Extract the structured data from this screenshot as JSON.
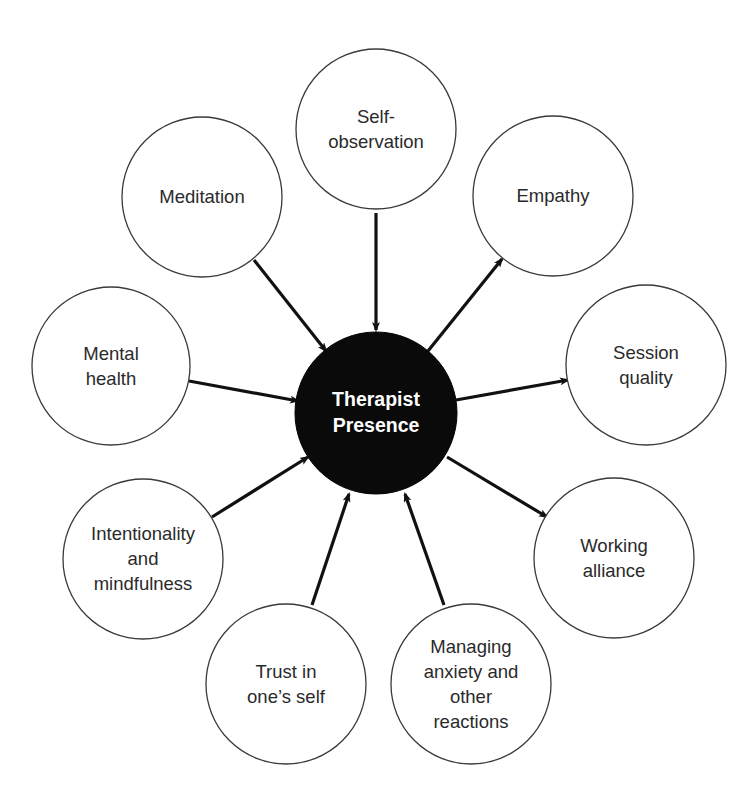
{
  "diagram": {
    "type": "hub-and-spoke",
    "center": {
      "id": "therapist-presence",
      "label_lines": [
        "Therapist",
        "Presence"
      ],
      "cx": 376,
      "cy": 413,
      "r": 81,
      "fill": "#0a0a0a",
      "text_color": "#ffffff"
    },
    "nodes": [
      {
        "id": "self-observation",
        "label_lines": [
          "Self-",
          "observation"
        ],
        "cx": 376,
        "cy": 129,
        "r": 80,
        "direction": "in",
        "arrow": {
          "x1": 376,
          "y1": 213,
          "x2": 376,
          "y2": 330
        }
      },
      {
        "id": "meditation",
        "label_lines": [
          "Meditation"
        ],
        "cx": 202,
        "cy": 197,
        "r": 80,
        "direction": "in",
        "arrow": {
          "x1": 254,
          "y1": 260,
          "x2": 326,
          "y2": 351
        }
      },
      {
        "id": "empathy",
        "label_lines": [
          "Empathy"
        ],
        "cx": 553,
        "cy": 196,
        "r": 80,
        "direction": "out",
        "arrow": {
          "x1": 428,
          "y1": 351,
          "x2": 502,
          "y2": 259
        }
      },
      {
        "id": "mental-health",
        "label_lines": [
          "Mental",
          "health"
        ],
        "cx": 111,
        "cy": 366,
        "r": 79,
        "direction": "in",
        "arrow": {
          "x1": 189,
          "y1": 381,
          "x2": 298,
          "y2": 401
        }
      },
      {
        "id": "session-quality",
        "label_lines": [
          "Session",
          "quality"
        ],
        "cx": 646,
        "cy": 365,
        "r": 80,
        "direction": "out",
        "arrow": {
          "x1": 456,
          "y1": 400,
          "x2": 568,
          "y2": 380
        }
      },
      {
        "id": "intentionality-and-mindfulness",
        "label_lines": [
          "Intentionality",
          "and",
          "mindfulness"
        ],
        "cx": 143,
        "cy": 559,
        "r": 80,
        "direction": "in",
        "arrow": {
          "x1": 212,
          "y1": 517,
          "x2": 308,
          "y2": 457
        }
      },
      {
        "id": "working-alliance",
        "label_lines": [
          "Working",
          "alliance"
        ],
        "cx": 614,
        "cy": 558,
        "r": 80,
        "direction": "out",
        "arrow": {
          "x1": 447,
          "y1": 457,
          "x2": 547,
          "y2": 517
        }
      },
      {
        "id": "trust-in-ones-self",
        "label_lines": [
          "Trust in",
          "one’s self"
        ],
        "cx": 286,
        "cy": 684,
        "r": 80,
        "direction": "in",
        "arrow": {
          "x1": 312,
          "y1": 605,
          "x2": 349,
          "y2": 494
        }
      },
      {
        "id": "managing-anxiety-and-other-reactions",
        "label_lines": [
          "Managing",
          "anxiety and",
          "other",
          "reactions"
        ],
        "cx": 471,
        "cy": 684,
        "r": 80,
        "direction": "in",
        "arrow": {
          "x1": 444,
          "y1": 605,
          "x2": 405,
          "y2": 494
        }
      }
    ],
    "colors": {
      "background": "#ffffff",
      "node_stroke": "#3a3a3a",
      "node_fill": "#ffffff",
      "text": "#2a2a2a",
      "arrow": "#111111"
    }
  }
}
